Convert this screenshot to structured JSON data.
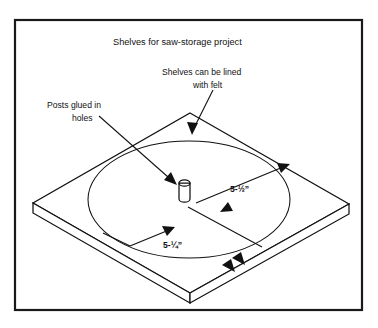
{
  "figure": {
    "title": "Shelves for saw-storage project",
    "background_color": "#ffffff",
    "line_color": "#111111",
    "frame_color": "#1a1a1a",
    "annotations": {
      "felt_note_line1": "Shelves can be lined",
      "felt_note_line2": "with felt",
      "posts_note_line1": "Posts glued in",
      "posts_note_line2": "holes"
    },
    "dimensions": {
      "outer_diameter": "5-½”",
      "inner_diameter": "5-¼”"
    },
    "parts": {
      "board_label": "shelf-board",
      "circle_label": "shelf-circle-outline",
      "post_label": "glued-post"
    }
  }
}
